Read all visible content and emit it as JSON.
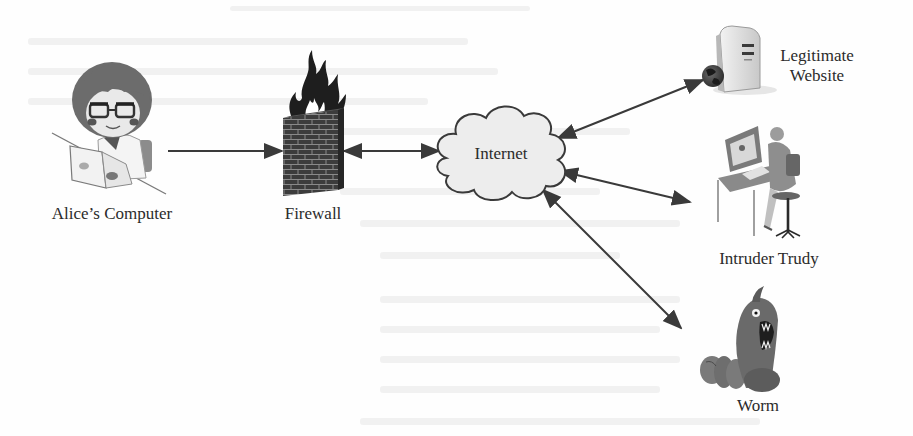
{
  "figure": {
    "nodes": [
      {
        "id": "alice",
        "label": "Alice’s Computer",
        "icon": "person-laptop-icon"
      },
      {
        "id": "firewall",
        "label": "Firewall",
        "icon": "burning-brick-wall-icon"
      },
      {
        "id": "internet",
        "label": "Internet",
        "icon": "cloud-icon"
      },
      {
        "id": "website",
        "label_line1": "Legitimate",
        "label_line2": "Website",
        "icon": "server-globe-icon"
      },
      {
        "id": "trudy",
        "label": "Intruder Trudy",
        "icon": "person-at-desk-icon"
      },
      {
        "id": "worm",
        "label": "Worm",
        "icon": "worm-monster-icon"
      }
    ],
    "edges": [
      {
        "from": "alice",
        "to": "firewall",
        "direction": "one-way"
      },
      {
        "from": "firewall",
        "to": "internet",
        "direction": "bidirectional"
      },
      {
        "from": "internet",
        "to": "website",
        "direction": "bidirectional"
      },
      {
        "from": "internet",
        "to": "trudy",
        "direction": "bidirectional"
      },
      {
        "from": "internet",
        "to": "worm",
        "direction": "bidirectional"
      }
    ]
  },
  "colors": {
    "background": "#fefefe",
    "ink": "#2b2b2b",
    "arrow": "#3a3a3a",
    "cloud_fill": "#ececec",
    "wall": "#3c3c3c",
    "flame": "#1e1e1e",
    "bleed_through": "#ececec"
  }
}
